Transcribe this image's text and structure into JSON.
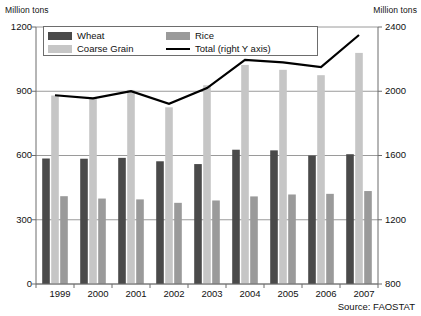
{
  "axis": {
    "unit_left": "Million tons",
    "unit_right": "Million tons",
    "left_ticks": [
      "1200",
      "900",
      "600",
      "300",
      "0"
    ],
    "right_ticks": [
      "2400",
      "2000",
      "1600",
      "1200",
      "800"
    ]
  },
  "legend": {
    "wheat": "Wheat",
    "rice": "Rice",
    "coarse_grain": "Coarse Grain",
    "total": "Total (right Y axis)"
  },
  "source": "Source: FAOSTAT",
  "colors": {
    "wheat": "#4a4a4a",
    "rice": "#9a9a9a",
    "coarse_grain": "#c6c6c6",
    "total_line": "#000000",
    "grid": "#8f8f8f",
    "axis": "#6d6d6d"
  },
  "chart_data": {
    "type": "bar",
    "title": "",
    "subtitle": "",
    "xlabel": "",
    "ylabel": "Million tons",
    "ylabel_right": "Million tons",
    "ylim": [
      0,
      1200
    ],
    "ylim_right": [
      800,
      2400
    ],
    "yticks": [
      0,
      300,
      600,
      900,
      1200
    ],
    "yticks_right": [
      800,
      1200,
      1600,
      2000,
      2400
    ],
    "grid": true,
    "legend_position": "top-left",
    "categories": [
      "1999",
      "2000",
      "2001",
      "2002",
      "2003",
      "2004",
      "2005",
      "2006",
      "2007"
    ],
    "series": [
      {
        "name": "Wheat",
        "type": "bar",
        "axis": "left",
        "values": [
          586,
          585,
          589,
          573,
          560,
          627,
          624,
          600,
          606
        ]
      },
      {
        "name": "Coarse Grain",
        "type": "bar",
        "axis": "left",
        "values": [
          880,
          870,
          906,
          825,
          928,
          1023,
          1000,
          975,
          1079
        ]
      },
      {
        "name": "Rice",
        "type": "bar",
        "axis": "left",
        "values": [
          410,
          399,
          395,
          379,
          390,
          409,
          418,
          421,
          434
        ]
      },
      {
        "name": "Total",
        "type": "line",
        "axis": "right",
        "values": [
          1975,
          1956,
          2000,
          1922,
          2020,
          2195,
          2180,
          2150,
          2350
        ]
      }
    ]
  }
}
